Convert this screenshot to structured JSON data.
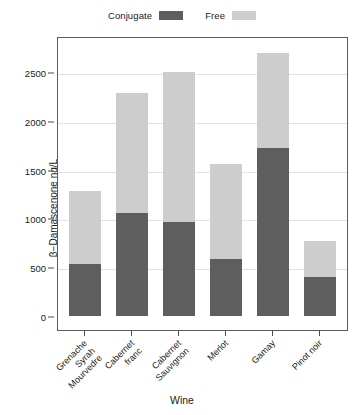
{
  "legend": {
    "position": "top-center",
    "entries": [
      {
        "label": "Conjugate",
        "color": "#5e5e5e"
      },
      {
        "label": "Free",
        "color": "#cdcdcd"
      }
    ]
  },
  "axes": {
    "y_title": "β−Damascenone ng/L",
    "x_title": "Wine",
    "y_ticks": [
      "0",
      "500",
      "1000",
      "1500",
      "2000",
      "2500"
    ]
  },
  "chart_data": {
    "type": "bar",
    "subtype": "stacked",
    "title": "",
    "xlabel": "Wine",
    "ylabel": "β−Damascenone ng/L",
    "ylim": [
      0,
      2800
    ],
    "yticks": [
      0,
      500,
      1000,
      1500,
      2000,
      2500
    ],
    "grid": true,
    "legend_position": "top-center",
    "categories": [
      "Grenache Syrah Mourvedre",
      "Cabernet franc",
      "Cabernet Sauvignon",
      "Merlot",
      "Gamay",
      "Pinot noir"
    ],
    "series": [
      {
        "name": "Conjugate",
        "color": "#5e5e5e",
        "values": [
          530,
          1060,
          960,
          580,
          1720,
          400
        ]
      },
      {
        "name": "Free",
        "color": "#cdcdcd",
        "values": [
          755,
          1220,
          1540,
          975,
          975,
          365
        ]
      }
    ],
    "totals": [
      1285,
      2280,
      2500,
      1555,
      2695,
      765
    ]
  }
}
